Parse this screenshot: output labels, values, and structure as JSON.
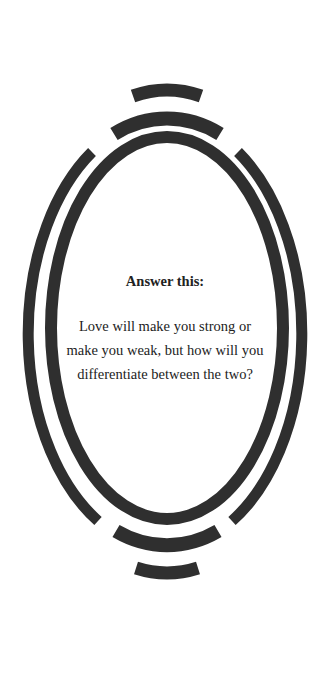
{
  "card": {
    "heading": "Answer this:",
    "lines": [
      "Love will make you strong or",
      "make you weak, but how will you",
      "differentiate between the two?"
    ]
  },
  "colors": {
    "background": "#ffffff",
    "frame": "#2f2f2f",
    "text": "#222222"
  },
  "decoration": {
    "shape": "oval-frame-with-concentric-arcs"
  }
}
